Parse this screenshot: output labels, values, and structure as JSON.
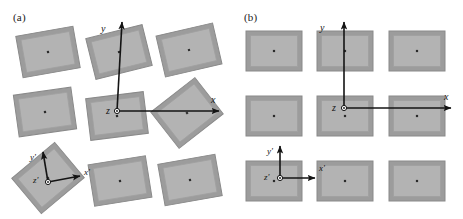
{
  "figure": {
    "width": 463,
    "height": 219,
    "background": "#ffffff"
  },
  "colors": {
    "rect_fill": "#b3b3b3",
    "rect_band": "#9c9c9c",
    "rect_outline": "#8a8a8a",
    "rect_inner_line": "#a0a0a0",
    "center_dot": "#2b2b2b",
    "axis": "#141414",
    "text": "#141414"
  },
  "panels": [
    {
      "id": "a",
      "label": "(a)",
      "label_x": 13,
      "label_y": 22,
      "arrangement": "misaligned",
      "global_axes": {
        "origin": {
          "x": 117,
          "y": 111
        },
        "y_axis": {
          "label": "y",
          "label_x": 101,
          "label_y": 32,
          "tip_x": 122,
          "tip_y": 22
        },
        "x_axis": {
          "label": "x",
          "label_x": 211,
          "label_y": 103,
          "tip_x": 219,
          "tip_y": 111
        },
        "z_axis": {
          "label": "z",
          "label_x": 106,
          "label_y": 114
        }
      },
      "local_axes": {
        "origin": {
          "x": 48,
          "y": 182
        },
        "y_axis": {
          "label": "y'",
          "label_x": 30,
          "label_y": 160,
          "tip_x": 43,
          "tip_y": 152
        },
        "x_axis": {
          "label": "x'",
          "label_x": 84,
          "label_y": 175,
          "tip_x": 80,
          "tip_y": 176
        },
        "z_axis": {
          "label": "z'",
          "label_x": 33,
          "label_y": 183
        }
      },
      "rectangles": [
        {
          "cx": 48,
          "cy": 52,
          "w": 58,
          "h": 42,
          "rot": -10
        },
        {
          "cx": 119,
          "cy": 52,
          "w": 58,
          "h": 42,
          "rot": -14
        },
        {
          "cx": 189,
          "cy": 50,
          "w": 58,
          "h": 42,
          "rot": -13
        },
        {
          "cx": 45,
          "cy": 112,
          "w": 58,
          "h": 42,
          "rot": -8
        },
        {
          "cx": 117,
          "cy": 116,
          "w": 58,
          "h": 42,
          "rot": -7
        },
        {
          "cx": 187,
          "cy": 113,
          "w": 56,
          "h": 46,
          "rot": -38
        },
        {
          "cx": 48,
          "cy": 178,
          "w": 56,
          "h": 46,
          "rot": -40
        },
        {
          "cx": 120,
          "cy": 181,
          "w": 58,
          "h": 42,
          "rot": -9
        },
        {
          "cx": 190,
          "cy": 180,
          "w": 58,
          "h": 42,
          "rot": -10
        }
      ]
    },
    {
      "id": "b",
      "label": "(b)",
      "label_x": 13,
      "label_y": 22,
      "arrangement": "aligned",
      "global_axes": {
        "origin": {
          "x": 113,
          "y": 108
        },
        "y_axis": {
          "label": "y",
          "label_x": 89,
          "label_y": 31,
          "tip_x": 113,
          "tip_y": 22
        },
        "x_axis": {
          "label": "x",
          "label_x": 213,
          "label_y": 100,
          "tip_x": 220,
          "tip_y": 108
        },
        "z_axis": {
          "label": "z",
          "label_x": 101,
          "label_y": 111
        }
      },
      "local_axes": {
        "origin": {
          "x": 49,
          "y": 178
        },
        "y_axis": {
          "label": "y'",
          "label_x": 36,
          "label_y": 154,
          "tip_x": 49,
          "tip_y": 146
        },
        "x_axis": {
          "label": "x'",
          "label_x": 88,
          "label_y": 171,
          "tip_x": 84,
          "tip_y": 178
        },
        "z_axis": {
          "label": "z'",
          "label_x": 33,
          "label_y": 180
        }
      },
      "rectangles": [
        {
          "cx": 43,
          "cy": 51,
          "w": 56,
          "h": 40,
          "rot": 0
        },
        {
          "cx": 114,
          "cy": 51,
          "w": 56,
          "h": 40,
          "rot": 0
        },
        {
          "cx": 186,
          "cy": 51,
          "w": 56,
          "h": 40,
          "rot": 0
        },
        {
          "cx": 43,
          "cy": 116,
          "w": 56,
          "h": 40,
          "rot": 0
        },
        {
          "cx": 114,
          "cy": 116,
          "w": 56,
          "h": 40,
          "rot": 0
        },
        {
          "cx": 186,
          "cy": 116,
          "w": 56,
          "h": 40,
          "rot": 0
        },
        {
          "cx": 43,
          "cy": 181,
          "w": 56,
          "h": 40,
          "rot": 0
        },
        {
          "cx": 114,
          "cy": 181,
          "w": 56,
          "h": 40,
          "rot": 0
        },
        {
          "cx": 186,
          "cy": 181,
          "w": 56,
          "h": 40,
          "rot": 0
        }
      ]
    }
  ]
}
